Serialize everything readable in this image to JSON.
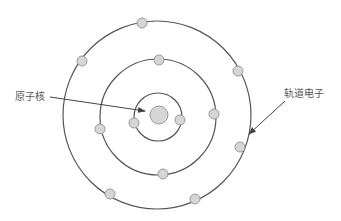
{
  "diagram": {
    "labels": {
      "nucleus": "原子核",
      "orbital_electron": "轨道电子"
    },
    "colors": {
      "orbit_stroke": "#555555",
      "electron_fill": "#d6d6d6",
      "electron_stroke": "#9a9a9a",
      "arrow": "#444444",
      "text": "#555555"
    },
    "nucleus": {
      "cx": 159,
      "cy": 115,
      "r": 9
    },
    "orbits": [
      {
        "name": "inner",
        "cx": 158,
        "cy": 117,
        "r": 24
      },
      {
        "name": "middle",
        "cx": 158,
        "cy": 117,
        "r": 58
      },
      {
        "name": "outer",
        "cx": 157,
        "cy": 115,
        "r": 94
      }
    ],
    "electrons": [
      {
        "orbit": "inner",
        "cx": 134,
        "cy": 123
      },
      {
        "orbit": "inner",
        "cx": 180,
        "cy": 120
      },
      {
        "orbit": "middle",
        "cx": 159,
        "cy": 60
      },
      {
        "orbit": "middle",
        "cx": 214,
        "cy": 114
      },
      {
        "orbit": "middle",
        "cx": 100,
        "cy": 129
      },
      {
        "orbit": "middle",
        "cx": 163,
        "cy": 174
      },
      {
        "orbit": "outer",
        "cx": 142,
        "cy": 23
      },
      {
        "orbit": "outer",
        "cx": 82,
        "cy": 61
      },
      {
        "orbit": "outer",
        "cx": 238,
        "cy": 71
      },
      {
        "orbit": "outer",
        "cx": 240,
        "cy": 147
      },
      {
        "orbit": "outer",
        "cx": 110,
        "cy": 194
      },
      {
        "orbit": "outer",
        "cx": 195,
        "cy": 199
      }
    ]
  }
}
